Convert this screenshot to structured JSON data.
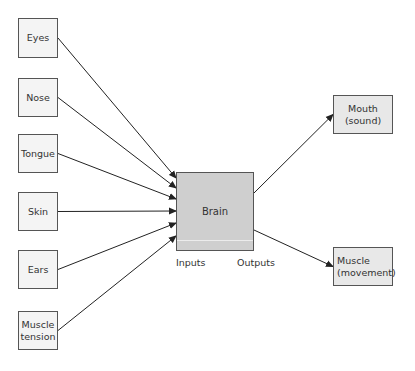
{
  "diagram": {
    "inputs": [
      {
        "label": "Eyes",
        "box": [
          18,
          18,
          40,
          40
        ],
        "target_y": 178
      },
      {
        "label": "Nose",
        "box": [
          18,
          78,
          40,
          39
        ],
        "target_y": 188
      },
      {
        "label": "Tongue",
        "box": [
          18,
          134,
          40,
          39
        ],
        "target_y": 199
      },
      {
        "label": "Skin",
        "box": [
          18,
          192,
          40,
          39
        ],
        "target_y": 211
      },
      {
        "label": "Ears",
        "box": [
          18,
          250,
          40,
          39
        ],
        "target_y": 223
      },
      {
        "label": "Muscle\ntension",
        "box": [
          18,
          311,
          40,
          39
        ],
        "target_y": 236
      }
    ],
    "center": {
      "label": "Brain",
      "box": [
        176,
        172,
        78,
        79
      ]
    },
    "outputs": [
      {
        "label": "Mouth\n(sound)",
        "box": [
          333,
          95,
          60,
          39
        ],
        "from_y": 193
      },
      {
        "label": "Muscle\n(movement)",
        "box": [
          333,
          247,
          60,
          39
        ],
        "from_y": 230
      }
    ],
    "annotations": {
      "inputs_label": "Inputs",
      "outputs_label": "Outputs"
    },
    "colors": {
      "input_fill": "#f4f4f4",
      "brain_fill": "#cfcfcf",
      "output_fill": "#e8e8e8",
      "stroke": "#555555",
      "arrow": "#222222"
    }
  }
}
